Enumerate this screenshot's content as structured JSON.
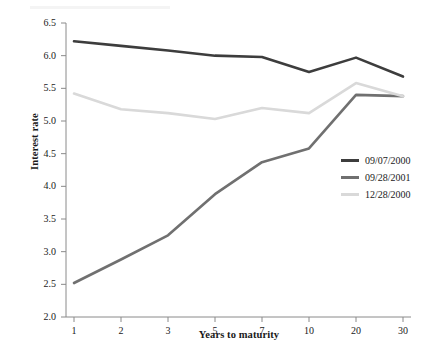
{
  "chart_data": {
    "type": "line",
    "title": "",
    "xlabel": "Years to maturity",
    "ylabel": "Interest rate",
    "categories": [
      "1",
      "2",
      "3",
      "5",
      "7",
      "10",
      "20",
      "30"
    ],
    "x": [
      1,
      2,
      3,
      5,
      7,
      10,
      20,
      30
    ],
    "ylim": [
      2.0,
      6.5
    ],
    "ytick_labels": [
      "2.0",
      "2.5",
      "3.0",
      "3.5",
      "4.0",
      "4.5",
      "5.0",
      "5.5",
      "6.0",
      "6.5"
    ],
    "yticks": [
      2.0,
      2.5,
      3.0,
      3.5,
      4.0,
      4.5,
      5.0,
      5.5,
      6.0,
      6.5
    ],
    "grid": false,
    "legend_position": "center-right",
    "series": [
      {
        "name": "09/07/2000",
        "color": "#3d3d3d",
        "values": [
          6.22,
          6.15,
          6.08,
          6.0,
          5.98,
          5.75,
          5.97,
          5.68
        ]
      },
      {
        "name": "09/28/2001",
        "color": "#707070",
        "values": [
          2.52,
          2.88,
          3.25,
          3.88,
          4.37,
          4.58,
          5.4,
          5.38
        ]
      },
      {
        "name": "12/28/2000",
        "color": "#d9d9d9",
        "values": [
          5.42,
          5.18,
          5.12,
          5.03,
          5.2,
          5.12,
          5.58,
          5.38
        ]
      }
    ]
  },
  "axis": {
    "axis_color": "#8a8a8a",
    "label_color": "#1a1a1a"
  }
}
